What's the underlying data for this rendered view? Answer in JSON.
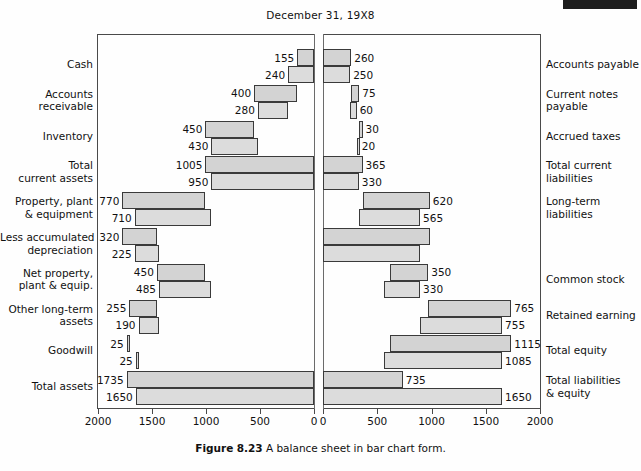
{
  "figure": {
    "title": "December 31, 19X8",
    "caption_prefix": "Figure",
    "caption_number": "8.23",
    "caption_text": "A balance sheet in bar chart form."
  },
  "axis": {
    "left_ticks": [
      "2000",
      "1500",
      "1000",
      "500",
      "0"
    ],
    "right_ticks": [
      "0",
      "500",
      "1000",
      "1500",
      "2000"
    ],
    "max": 2000,
    "unit_step": 500
  },
  "chart_data": {
    "type": "bar",
    "orientation": "horizontal-bidirectional",
    "title": "December 31, 19X8",
    "xlabel": "",
    "ylabel": "",
    "xlim": [
      0,
      2000
    ],
    "grid": false,
    "legend": "none",
    "series": [
      {
        "name": "Current year"
      },
      {
        "name": "Prior year"
      }
    ],
    "left_panel": {
      "side": "assets",
      "direction": "right-to-left",
      "categories": [
        "Cash",
        "Accounts receivable",
        "Inventory",
        "Total current assets",
        "Property, plant & equipment",
        "Less accumulated depreciation",
        "Net property, plant & equip.",
        "Other long-term assets",
        "Goodwill",
        "Total assets"
      ],
      "rows": [
        {
          "label_line1": "Cash",
          "label_line2": "",
          "current": 155,
          "prior": 240,
          "current_offset": 0,
          "prior_offset": 0
        },
        {
          "label_line1": "Accounts",
          "label_line2": "receivable",
          "current": 400,
          "prior": 280,
          "current_offset": 155,
          "prior_offset": 240
        },
        {
          "label_line1": "Inventory",
          "label_line2": "",
          "current": 450,
          "prior": 430,
          "current_offset": 555,
          "prior_offset": 520
        },
        {
          "label_line1": "Total",
          "label_line2": "current assets",
          "current": 1005,
          "prior": 950,
          "current_offset": 0,
          "prior_offset": 0
        },
        {
          "label_line1": "Property, plant",
          "label_line2": "& equipment",
          "current": 770,
          "prior": 710,
          "current_offset": 1005,
          "prior_offset": 950
        },
        {
          "label_line1": "Less accumulated",
          "label_line2": "depreciation",
          "current": 320,
          "prior": 225,
          "current_offset": 1455,
          "prior_offset": 1435
        },
        {
          "label_line1": "Net property,",
          "label_line2": "plant & equip.",
          "current": 450,
          "prior": 485,
          "current_offset": 1005,
          "prior_offset": 950
        },
        {
          "label_line1": "Other long-term",
          "label_line2": "assets",
          "current": 255,
          "prior": 190,
          "current_offset": 1455,
          "prior_offset": 1435
        },
        {
          "label_line1": "Goodwill",
          "label_line2": "",
          "current": 25,
          "prior": 25,
          "current_offset": 1710,
          "prior_offset": 1625
        },
        {
          "label_line1": "Total assets",
          "label_line2": "",
          "current": 1735,
          "prior": 1650,
          "current_offset": 0,
          "prior_offset": 0
        }
      ]
    },
    "right_panel": {
      "side": "liabilities-and-equity",
      "direction": "left-to-right",
      "categories": [
        "Accounts payable",
        "Current notes payable",
        "Accrued taxes",
        "Total current liabilities",
        "Long-term liabilities",
        "",
        "Common stock",
        "Retained earning",
        "Total equity",
        "Total liabilities & equity"
      ],
      "rows": [
        {
          "label_line1": "Accounts payable",
          "label_line2": "",
          "current": 260,
          "prior": 250,
          "current_offset": 0,
          "prior_offset": 0
        },
        {
          "label_line1": "Current notes",
          "label_line2": "payable",
          "current": 75,
          "prior": 60,
          "current_offset": 260,
          "prior_offset": 250
        },
        {
          "label_line1": "Accrued taxes",
          "label_line2": "",
          "current": 30,
          "prior": 20,
          "current_offset": 335,
          "prior_offset": 310
        },
        {
          "label_line1": "Total current",
          "label_line2": "liabilities",
          "current": 365,
          "prior": 330,
          "current_offset": 0,
          "prior_offset": 0
        },
        {
          "label_line1": "Long-term",
          "label_line2": "liabilities",
          "current": 620,
          "prior": 565,
          "current_offset": 365,
          "prior_offset": 330
        },
        {
          "label_line1": "",
          "label_line2": "",
          "current": 985,
          "prior": 895,
          "current_offset": 0,
          "prior_offset": 0
        },
        {
          "label_line1": "Common stock",
          "label_line2": "",
          "current": 350,
          "prior": 330,
          "current_offset": 620,
          "prior_offset": 565
        },
        {
          "label_line1": "Retained earning",
          "label_line2": "",
          "current": 765,
          "prior": 755,
          "current_offset": 970,
          "prior_offset": 895
        },
        {
          "label_line1": "Total equity",
          "label_line2": "",
          "current": 1115,
          "prior": 1085,
          "current_offset": 620,
          "prior_offset": 565
        },
        {
          "label_line1": "Total liabilities",
          "label_line2": "& equity",
          "current": 735,
          "prior": 1650,
          "current_offset": 0,
          "prior_offset": 0
        }
      ]
    }
  },
  "colors": {
    "bar_fill": "#d3d3d3",
    "bar_fill_prior": "#dcdcdc",
    "bar_stroke": "#3a3a3a",
    "frame": "#4a4a4a",
    "text": "#111111"
  }
}
